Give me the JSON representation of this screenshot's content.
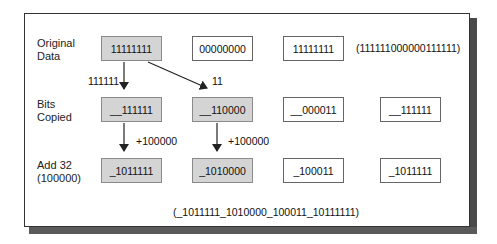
{
  "rows": [
    {
      "label_line1": "Original",
      "label_line2": "Data",
      "boxes": [
        "11111111",
        "00000000",
        "11111111"
      ],
      "summary": "(111111000000111111)"
    },
    {
      "label_line1": "Bits",
      "label_line2": "Copied",
      "boxes": [
        "__111111",
        "__110000",
        "__000011",
        "__111111"
      ]
    },
    {
      "label_line1": "Add 32",
      "label_line2": "(100000)",
      "boxes": [
        "_1011111",
        "_1010000",
        "_100011",
        "_1011111"
      ]
    }
  ],
  "arrow_labels": {
    "copy_down": "111111",
    "copy_diag": "11",
    "add_col1": "+100000",
    "add_col2": "+100000"
  },
  "result": "(_1011111_1010000_100011_10111111)",
  "colors": {
    "shaded_box": "#d4d4d4",
    "frame_shadow": "#4a4a4a"
  }
}
